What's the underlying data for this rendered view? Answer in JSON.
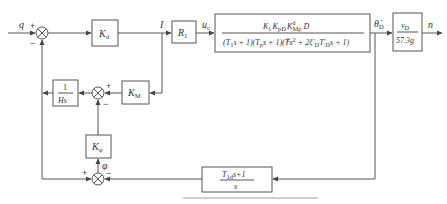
{
  "diagram": {
    "type": "control-block-diagram",
    "signals": {
      "input": "q",
      "current": "I",
      "control_voltage": {
        "base": "u",
        "sub": "c"
      },
      "attitude_rate": {
        "base": "θ̇",
        "sub": "D"
      },
      "output": "n",
      "phi": "φ"
    },
    "blocks": {
      "kd": {
        "base": "K",
        "sub": "d"
      },
      "r1": {
        "base": "R",
        "sub": "1"
      },
      "plant": {
        "numerator": "K₁K_pDK^d_MpD",
        "numerator_parts": [
          {
            "base": "K",
            "sub": "1"
          },
          {
            "base": "K",
            "sub": "pD"
          },
          {
            "base": "K",
            "sub": "Mp",
            "sup": "d"
          },
          {
            "base": "D"
          }
        ],
        "denominator": "(T₁s + 1)(T_ps + 1)(T_D²s² + 2ξ′_DT′_Ds + 1)",
        "denominator_parts": [
          "(T",
          "1",
          "s + 1)(T",
          "p",
          "s + 1)(T",
          "D",
          "2",
          "s",
          "2",
          " + 2ξ′",
          "D",
          "T′",
          "D",
          "s + 1)"
        ]
      },
      "gain": {
        "numerator": {
          "base": "v",
          "sub": "D"
        },
        "denominator": "57.3g"
      },
      "km": {
        "base": "K",
        "sub": "M"
      },
      "integrator": {
        "numerator": "1",
        "denominator": "Hs"
      },
      "kphi": {
        "base": "K",
        "sub": "φ"
      },
      "feedback": {
        "numerator_base": "T",
        "numerator_sub": "1d",
        "numerator_rest": "s+1",
        "denominator": "s"
      }
    },
    "summing_junctions": {
      "sum1": {
        "signs": [
          "+",
          "−"
        ]
      },
      "sum2": {
        "signs": [
          "+",
          "−"
        ]
      },
      "sum3": {
        "signs": [
          "+",
          "−"
        ]
      }
    }
  },
  "caption": {
    "visible": true,
    "legible": false
  }
}
